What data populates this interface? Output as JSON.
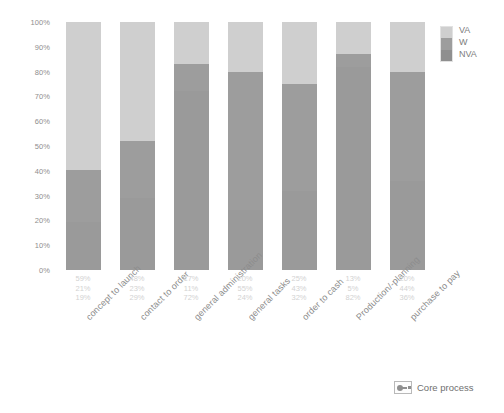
{
  "chart_data": {
    "type": "bar",
    "subtype": "stacked-100-percent",
    "title": "",
    "xlabel": "",
    "ylabel": "",
    "ylim": [
      0,
      100
    ],
    "y_tick_labels": [
      "100%",
      "90%",
      "80%",
      "70%",
      "60%",
      "50%",
      "40%",
      "30%",
      "20%",
      "10%",
      "0%"
    ],
    "y_ticks": [
      100,
      90,
      80,
      70,
      60,
      50,
      40,
      30,
      20,
      10,
      0
    ],
    "grid": false,
    "legend_position": "top-right",
    "stack_order_top_to_bottom": [
      "VA",
      "W",
      "NVA"
    ],
    "categories": [
      "concept to launch",
      "contact to order",
      "general administration",
      "general tasks",
      "order to cash",
      "Production/-planning",
      "purchase to pay"
    ],
    "series": [
      {
        "name": "VA",
        "color": "#cfcfcf",
        "values": [
          59,
          48,
          17,
          20,
          25,
          13,
          20
        ],
        "labels": [
          "59%",
          "48%",
          "17%",
          "20%",
          "25%",
          "13%",
          "20%"
        ]
      },
      {
        "name": "W",
        "color": "#9d9d9d",
        "values": [
          21,
          23,
          11,
          55,
          43,
          5,
          44
        ],
        "labels": [
          "21%",
          "23%",
          "11%",
          "55%",
          "43%",
          "5%",
          "44%"
        ]
      },
      {
        "name": "NVA",
        "color": "#9a9a9a",
        "values": [
          19,
          29,
          72,
          24,
          32,
          82,
          36
        ],
        "labels": [
          "19%",
          "29%",
          "72%",
          "24%",
          "32%",
          "82%",
          "36%"
        ]
      }
    ]
  },
  "legend": {
    "entries": [
      {
        "label": "VA"
      },
      {
        "label": "W"
      },
      {
        "label": "NVA"
      }
    ]
  },
  "footer": {
    "icon_name": "core-process-icon",
    "text": "Core process"
  }
}
